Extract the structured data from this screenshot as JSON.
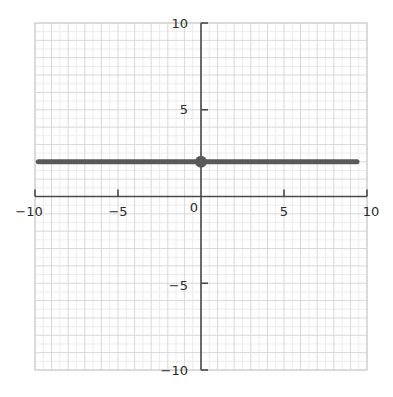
{
  "chart_data": {
    "type": "line",
    "title": "",
    "xlabel": "",
    "ylabel": "",
    "xlim": [
      -10,
      10
    ],
    "ylim": [
      -10,
      10
    ],
    "grid": true,
    "grid_minor_step": 0.5,
    "grid_major_step": 1,
    "legend": "none",
    "equation": "y = 2",
    "series": [
      {
        "name": "y = 2",
        "type": "line",
        "x": [
          -9.8,
          9.4
        ],
        "values": [
          2,
          2
        ],
        "color": "#595959"
      },
      {
        "name": "marked point",
        "type": "scatter",
        "x": [
          0
        ],
        "values": [
          2
        ],
        "color": "#595959"
      }
    ],
    "x_ticks": [
      {
        "value": -10,
        "label": "−10"
      },
      {
        "value": -5,
        "label": "−5"
      },
      {
        "value": 0,
        "label": "0"
      },
      {
        "value": 5,
        "label": "5"
      },
      {
        "value": 10,
        "label": "10"
      }
    ],
    "y_ticks": [
      {
        "value": 10,
        "label": "10"
      },
      {
        "value": 5,
        "label": "5"
      },
      {
        "value": -5,
        "label": "−5"
      },
      {
        "value": -10,
        "label": "−10"
      }
    ]
  },
  "colors": {
    "background": "#ffffff",
    "grid_minor": "#ececec",
    "grid_major": "#d8d8d8",
    "plot_border": "#cfcfcf",
    "axis": "#4a4a4a",
    "tick_text": "#2b2b2b",
    "data": "#595959"
  },
  "labels": {
    "x_neg10": "−10",
    "x_neg5": "−5",
    "x_zero": "0",
    "x_pos5": "5",
    "x_pos10": "10",
    "y_pos10": "10",
    "y_pos5": "5",
    "y_neg5": "−5",
    "y_neg10": "−10"
  }
}
